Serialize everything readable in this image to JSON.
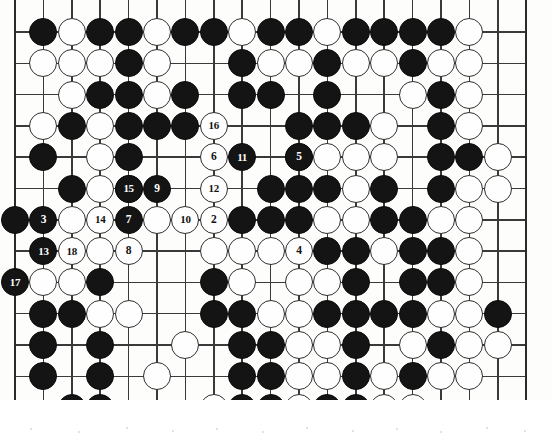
{
  "diagram": {
    "kind": "go-board-diagram",
    "board_size": 19,
    "visible_columns": 19,
    "visible_rows": 13,
    "geometry": {
      "origin_x": 15,
      "origin_y": 32,
      "col_step": 28.4,
      "row_step": 31.3,
      "stone_diameter": 28,
      "left_edge_visible": true,
      "right_edge_visible": true,
      "bottom_edge_visible": true,
      "top_edge_visible": false
    },
    "colors": {
      "black_stone": "#141414",
      "white_stone": "#fefefe",
      "stone_outline": "#2e2e2e",
      "grid_line": "#3a3a3a",
      "board_background": "#fdfdfb",
      "black_label_text": "#ffffff",
      "white_label_text": "#111111"
    },
    "star_points": [
      {
        "col": 15,
        "row": 12
      }
    ],
    "move_numbers": [
      {
        "n": "2",
        "color": "white",
        "col": 7,
        "row": 6
      },
      {
        "n": "3",
        "color": "black",
        "col": 1,
        "row": 6
      },
      {
        "n": "4",
        "color": "white",
        "col": 10,
        "row": 7
      },
      {
        "n": "5",
        "color": "black",
        "col": 10,
        "row": 4
      },
      {
        "n": "6",
        "color": "white",
        "col": 7,
        "row": 4
      },
      {
        "n": "7",
        "color": "black",
        "col": 4,
        "row": 6
      },
      {
        "n": "8",
        "color": "white",
        "col": 4,
        "row": 7
      },
      {
        "n": "9",
        "color": "black",
        "col": 5,
        "row": 5
      },
      {
        "n": "10",
        "color": "white",
        "col": 6,
        "row": 6
      },
      {
        "n": "11",
        "color": "black",
        "col": 8,
        "row": 4
      },
      {
        "n": "12",
        "color": "white",
        "col": 7,
        "row": 5
      },
      {
        "n": "13",
        "color": "black",
        "col": 1,
        "row": 7
      },
      {
        "n": "14",
        "color": "white",
        "col": 3,
        "row": 6
      },
      {
        "n": "15",
        "color": "black",
        "col": 4,
        "row": 5
      },
      {
        "n": "16",
        "color": "white",
        "col": 7,
        "row": 3
      },
      {
        "n": "17",
        "color": "black",
        "col": 0,
        "row": 8
      },
      {
        "n": "18",
        "color": "white",
        "col": 2,
        "row": 7
      }
    ],
    "stones": [
      {
        "col": 1,
        "row": 0,
        "color": "black"
      },
      {
        "col": 2,
        "row": 0,
        "color": "white"
      },
      {
        "col": 3,
        "row": 0,
        "color": "black"
      },
      {
        "col": 4,
        "row": 0,
        "color": "black"
      },
      {
        "col": 5,
        "row": 0,
        "color": "white"
      },
      {
        "col": 6,
        "row": 0,
        "color": "black"
      },
      {
        "col": 7,
        "row": 0,
        "color": "black"
      },
      {
        "col": 8,
        "row": 0,
        "color": "white"
      },
      {
        "col": 9,
        "row": 0,
        "color": "black"
      },
      {
        "col": 10,
        "row": 0,
        "color": "black"
      },
      {
        "col": 11,
        "row": 0,
        "color": "white"
      },
      {
        "col": 12,
        "row": 0,
        "color": "black"
      },
      {
        "col": 13,
        "row": 0,
        "color": "black"
      },
      {
        "col": 14,
        "row": 0,
        "color": "black"
      },
      {
        "col": 15,
        "row": 0,
        "color": "black"
      },
      {
        "col": 16,
        "row": 0,
        "color": "white"
      },
      {
        "col": 1,
        "row": 1,
        "color": "white"
      },
      {
        "col": 2,
        "row": 1,
        "color": "white"
      },
      {
        "col": 3,
        "row": 1,
        "color": "white"
      },
      {
        "col": 4,
        "row": 1,
        "color": "black"
      },
      {
        "col": 5,
        "row": 1,
        "color": "white"
      },
      {
        "col": 8,
        "row": 1,
        "color": "black"
      },
      {
        "col": 9,
        "row": 1,
        "color": "white"
      },
      {
        "col": 10,
        "row": 1,
        "color": "white"
      },
      {
        "col": 11,
        "row": 1,
        "color": "black"
      },
      {
        "col": 12,
        "row": 1,
        "color": "white"
      },
      {
        "col": 13,
        "row": 1,
        "color": "white"
      },
      {
        "col": 14,
        "row": 1,
        "color": "black"
      },
      {
        "col": 15,
        "row": 1,
        "color": "white"
      },
      {
        "col": 16,
        "row": 1,
        "color": "white"
      },
      {
        "col": 2,
        "row": 2,
        "color": "white"
      },
      {
        "col": 3,
        "row": 2,
        "color": "black"
      },
      {
        "col": 4,
        "row": 2,
        "color": "black"
      },
      {
        "col": 5,
        "row": 2,
        "color": "white"
      },
      {
        "col": 6,
        "row": 2,
        "color": "black"
      },
      {
        "col": 8,
        "row": 2,
        "color": "black"
      },
      {
        "col": 9,
        "row": 2,
        "color": "black"
      },
      {
        "col": 11,
        "row": 2,
        "color": "black"
      },
      {
        "col": 14,
        "row": 2,
        "color": "white"
      },
      {
        "col": 15,
        "row": 2,
        "color": "black"
      },
      {
        "col": 16,
        "row": 2,
        "color": "white"
      },
      {
        "col": 1,
        "row": 3,
        "color": "white"
      },
      {
        "col": 2,
        "row": 3,
        "color": "black"
      },
      {
        "col": 3,
        "row": 3,
        "color": "white"
      },
      {
        "col": 4,
        "row": 3,
        "color": "black"
      },
      {
        "col": 5,
        "row": 3,
        "color": "black"
      },
      {
        "col": 6,
        "row": 3,
        "color": "black"
      },
      {
        "col": 10,
        "row": 3,
        "color": "black"
      },
      {
        "col": 11,
        "row": 3,
        "color": "black"
      },
      {
        "col": 12,
        "row": 3,
        "color": "black"
      },
      {
        "col": 13,
        "row": 3,
        "color": "white"
      },
      {
        "col": 15,
        "row": 3,
        "color": "black"
      },
      {
        "col": 16,
        "row": 3,
        "color": "white"
      },
      {
        "col": 1,
        "row": 4,
        "color": "black"
      },
      {
        "col": 3,
        "row": 4,
        "color": "white"
      },
      {
        "col": 4,
        "row": 4,
        "color": "black"
      },
      {
        "col": 10,
        "row": 4,
        "color": "black"
      },
      {
        "col": 11,
        "row": 4,
        "color": "white"
      },
      {
        "col": 12,
        "row": 4,
        "color": "white"
      },
      {
        "col": 13,
        "row": 4,
        "color": "white"
      },
      {
        "col": 15,
        "row": 4,
        "color": "black"
      },
      {
        "col": 16,
        "row": 4,
        "color": "black"
      },
      {
        "col": 17,
        "row": 4,
        "color": "white"
      },
      {
        "col": 2,
        "row": 5,
        "color": "black"
      },
      {
        "col": 3,
        "row": 5,
        "color": "white"
      },
      {
        "col": 4,
        "row": 5,
        "color": "black"
      },
      {
        "col": 9,
        "row": 5,
        "color": "black"
      },
      {
        "col": 10,
        "row": 5,
        "color": "black"
      },
      {
        "col": 11,
        "row": 5,
        "color": "black"
      },
      {
        "col": 12,
        "row": 5,
        "color": "white"
      },
      {
        "col": 13,
        "row": 5,
        "color": "black"
      },
      {
        "col": 15,
        "row": 5,
        "color": "black"
      },
      {
        "col": 16,
        "row": 5,
        "color": "white"
      },
      {
        "col": 17,
        "row": 5,
        "color": "white"
      },
      {
        "col": 0,
        "row": 6,
        "color": "black"
      },
      {
        "col": 2,
        "row": 6,
        "color": "white"
      },
      {
        "col": 5,
        "row": 6,
        "color": "white"
      },
      {
        "col": 8,
        "row": 6,
        "color": "black"
      },
      {
        "col": 9,
        "row": 6,
        "color": "black"
      },
      {
        "col": 10,
        "row": 6,
        "color": "black"
      },
      {
        "col": 11,
        "row": 6,
        "color": "white"
      },
      {
        "col": 12,
        "row": 6,
        "color": "white"
      },
      {
        "col": 13,
        "row": 6,
        "color": "black"
      },
      {
        "col": 14,
        "row": 6,
        "color": "black"
      },
      {
        "col": 15,
        "row": 6,
        "color": "white"
      },
      {
        "col": 16,
        "row": 6,
        "color": "white"
      },
      {
        "col": 3,
        "row": 7,
        "color": "white"
      },
      {
        "col": 7,
        "row": 7,
        "color": "white"
      },
      {
        "col": 8,
        "row": 7,
        "color": "white"
      },
      {
        "col": 9,
        "row": 7,
        "color": "white"
      },
      {
        "col": 11,
        "row": 7,
        "color": "black"
      },
      {
        "col": 12,
        "row": 7,
        "color": "black"
      },
      {
        "col": 13,
        "row": 7,
        "color": "white"
      },
      {
        "col": 14,
        "row": 7,
        "color": "black"
      },
      {
        "col": 15,
        "row": 7,
        "color": "black"
      },
      {
        "col": 16,
        "row": 7,
        "color": "white"
      },
      {
        "col": 1,
        "row": 8,
        "color": "white"
      },
      {
        "col": 2,
        "row": 8,
        "color": "white"
      },
      {
        "col": 3,
        "row": 8,
        "color": "black"
      },
      {
        "col": 7,
        "row": 8,
        "color": "black"
      },
      {
        "col": 8,
        "row": 8,
        "color": "white"
      },
      {
        "col": 10,
        "row": 8,
        "color": "white"
      },
      {
        "col": 11,
        "row": 8,
        "color": "white"
      },
      {
        "col": 12,
        "row": 8,
        "color": "black"
      },
      {
        "col": 14,
        "row": 8,
        "color": "black"
      },
      {
        "col": 15,
        "row": 8,
        "color": "black"
      },
      {
        "col": 16,
        "row": 8,
        "color": "white"
      },
      {
        "col": 1,
        "row": 9,
        "color": "black"
      },
      {
        "col": 2,
        "row": 9,
        "color": "black"
      },
      {
        "col": 3,
        "row": 9,
        "color": "white"
      },
      {
        "col": 4,
        "row": 9,
        "color": "white"
      },
      {
        "col": 7,
        "row": 9,
        "color": "black"
      },
      {
        "col": 8,
        "row": 9,
        "color": "black"
      },
      {
        "col": 9,
        "row": 9,
        "color": "white"
      },
      {
        "col": 10,
        "row": 9,
        "color": "white"
      },
      {
        "col": 11,
        "row": 9,
        "color": "black"
      },
      {
        "col": 12,
        "row": 9,
        "color": "black"
      },
      {
        "col": 13,
        "row": 9,
        "color": "black"
      },
      {
        "col": 14,
        "row": 9,
        "color": "black"
      },
      {
        "col": 15,
        "row": 9,
        "color": "white"
      },
      {
        "col": 16,
        "row": 9,
        "color": "white"
      },
      {
        "col": 17,
        "row": 9,
        "color": "black"
      },
      {
        "col": 1,
        "row": 10,
        "color": "black"
      },
      {
        "col": 3,
        "row": 10,
        "color": "black"
      },
      {
        "col": 6,
        "row": 10,
        "color": "white"
      },
      {
        "col": 8,
        "row": 10,
        "color": "black"
      },
      {
        "col": 9,
        "row": 10,
        "color": "black"
      },
      {
        "col": 10,
        "row": 10,
        "color": "white"
      },
      {
        "col": 11,
        "row": 10,
        "color": "white"
      },
      {
        "col": 12,
        "row": 10,
        "color": "black"
      },
      {
        "col": 14,
        "row": 10,
        "color": "white"
      },
      {
        "col": 15,
        "row": 10,
        "color": "black"
      },
      {
        "col": 16,
        "row": 10,
        "color": "white"
      },
      {
        "col": 17,
        "row": 10,
        "color": "white"
      },
      {
        "col": 1,
        "row": 11,
        "color": "black"
      },
      {
        "col": 3,
        "row": 11,
        "color": "black"
      },
      {
        "col": 5,
        "row": 11,
        "color": "white"
      },
      {
        "col": 8,
        "row": 11,
        "color": "black"
      },
      {
        "col": 9,
        "row": 11,
        "color": "black"
      },
      {
        "col": 10,
        "row": 11,
        "color": "white"
      },
      {
        "col": 11,
        "row": 11,
        "color": "white"
      },
      {
        "col": 12,
        "row": 11,
        "color": "black"
      },
      {
        "col": 13,
        "row": 11,
        "color": "white"
      },
      {
        "col": 14,
        "row": 11,
        "color": "black"
      },
      {
        "col": 15,
        "row": 11,
        "color": "white"
      },
      {
        "col": 16,
        "row": 11,
        "color": "white"
      },
      {
        "col": 2,
        "row": 12,
        "color": "black"
      },
      {
        "col": 3,
        "row": 12,
        "color": "black"
      },
      {
        "col": 7,
        "row": 12,
        "color": "white"
      },
      {
        "col": 8,
        "row": 12,
        "color": "black"
      },
      {
        "col": 9,
        "row": 12,
        "color": "black"
      },
      {
        "col": 10,
        "row": 12,
        "color": "white"
      },
      {
        "col": 11,
        "row": 12,
        "color": "black"
      },
      {
        "col": 12,
        "row": 12,
        "color": "black"
      },
      {
        "col": 13,
        "row": 12,
        "color": "white"
      },
      {
        "col": 14,
        "row": 12,
        "color": "white"
      }
    ]
  }
}
